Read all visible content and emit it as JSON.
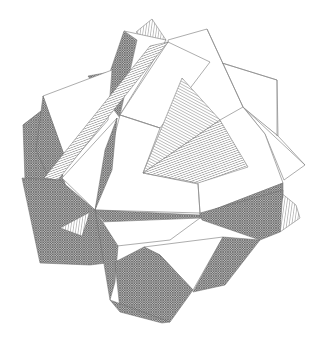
{
  "figure": {
    "subject": "Compound polyhedron line drawing",
    "background": "#ffffff",
    "line_color": "#8a8a8a",
    "shading": {
      "white_faces": "#ffffff",
      "dense_crosshatch": "#7a7a7a",
      "diagonal_hatch": "#555555",
      "vertical_hatch": "#555555"
    }
  }
}
